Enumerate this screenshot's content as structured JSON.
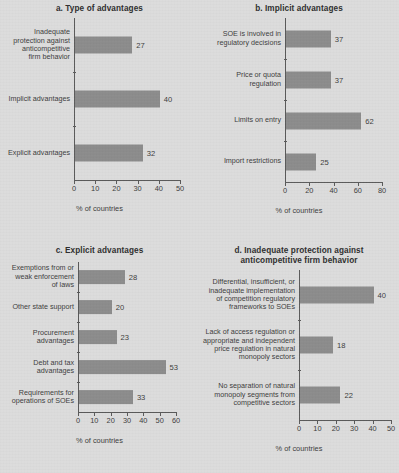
{
  "figure": {
    "background_color": "#dcdcdc",
    "bar_color": "#8c8c8c",
    "axis_color": "#5a5a5a",
    "text_color": "#3d3d3d"
  },
  "chart_data": [
    {
      "type": "bar",
      "orientation": "horizontal",
      "panel": "a",
      "title": "a. Type of advantages",
      "xlabel": "% of countries",
      "ylabel": "",
      "xlim": [
        0,
        50
      ],
      "xticks": [
        0,
        10,
        20,
        30,
        40,
        50
      ],
      "grid": false,
      "legend": null,
      "categories": [
        "Inadequate\nprotection against\nanticompetitive\nfirm behavior",
        "Implicit advantages",
        "Explicit advantages"
      ],
      "category_labels": [
        [
          "Inadequate",
          "protection against",
          "anticompetitive",
          "firm behavior"
        ],
        [
          "Implicit advantages"
        ],
        [
          "Explicit advantages"
        ]
      ],
      "values": [
        27,
        40,
        32
      ],
      "value_labels": [
        "27",
        "40",
        "32"
      ]
    },
    {
      "type": "bar",
      "orientation": "horizontal",
      "panel": "b",
      "title": "b. Implicit advantages",
      "xlabel": "% of countries",
      "ylabel": "",
      "xlim": [
        0,
        80
      ],
      "xticks": [
        0,
        20,
        40,
        60,
        80
      ],
      "grid": false,
      "legend": null,
      "categories": [
        "SOE is involved in\nregulatory decisions",
        "Price or quota\nregulation",
        "Limits on entry",
        "Import restrictions"
      ],
      "category_labels": [
        [
          "SOE is involved in",
          "regulatory decisions"
        ],
        [
          "Price or quota",
          "regulation"
        ],
        [
          "Limits on entry"
        ],
        [
          "Import restrictions"
        ]
      ],
      "values": [
        37,
        37,
        62,
        25
      ],
      "value_labels": [
        "37",
        "37",
        "62",
        "25"
      ]
    },
    {
      "type": "bar",
      "orientation": "horizontal",
      "panel": "c",
      "title": "c. Explicit advantages",
      "xlabel": "% of countries",
      "ylabel": "",
      "xlim": [
        0,
        60
      ],
      "xticks": [
        0,
        10,
        20,
        30,
        40,
        50,
        60
      ],
      "grid": false,
      "legend": null,
      "categories": [
        "Exemptions from or\nweak enforcement\nof laws",
        "Other state support",
        "Procurement\nadvantages",
        "Debt and tax\nadvantages",
        "Requirements for\noperations of SOEs"
      ],
      "category_labels": [
        [
          "Exemptions from or",
          "weak enforcement",
          "of laws"
        ],
        [
          "Other state support"
        ],
        [
          "Procurement",
          "advantages"
        ],
        [
          "Debt and tax",
          "advantages"
        ],
        [
          "Requirements for",
          "operations of SOEs"
        ]
      ],
      "values": [
        28,
        20,
        23,
        53,
        33
      ],
      "value_labels": [
        "28",
        "20",
        "23",
        "53",
        "33"
      ]
    },
    {
      "type": "bar",
      "orientation": "horizontal",
      "panel": "d",
      "title": "d. Inadequate protection against\nanticompetitive firm behavior",
      "title_lines": [
        "d. Inadequate protection against",
        "anticompetitive firm behavior"
      ],
      "xlabel": "% of countries",
      "ylabel": "",
      "xlim": [
        0,
        50
      ],
      "xticks": [
        0,
        10,
        20,
        30,
        40,
        50
      ],
      "grid": false,
      "legend": null,
      "categories": [
        "Differential, insufficient, or\ninadequate implementation\nof competition regulatory\nframeworks to SOEs",
        "Lack of access regulation or\nappropriate and independent\nprice regulation in natural\nmonopoly sectors",
        "No separation of natural\nmonopoly segments from\ncompetitive sectors"
      ],
      "category_labels": [
        [
          "Differential, insufficient, or",
          "inadequate implementation",
          "of competition regulatory",
          "frameworks to SOEs"
        ],
        [
          "Lack of access regulation or",
          "appropriate and independent",
          "price regulation in natural",
          "monopoly sectors"
        ],
        [
          "No separation of natural",
          "monopoly segments from",
          "competitive sectors"
        ]
      ],
      "values": [
        40,
        18,
        22
      ],
      "value_labels": [
        "40",
        "18",
        "22"
      ]
    }
  ]
}
